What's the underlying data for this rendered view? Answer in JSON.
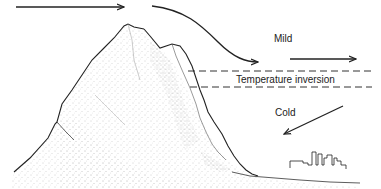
{
  "diagram": {
    "type": "illustration",
    "labels": {
      "mild": "Mild",
      "inversion": "Temperature inversion",
      "cold": "Cold"
    },
    "elements": [
      {
        "name": "mountain",
        "description": "stippled pen-and-ink mountain peak"
      },
      {
        "name": "wind-arrow-top",
        "description": "horizontal arrow above peak pointing right"
      },
      {
        "name": "wind-arrow-descending",
        "description": "curved arrow descending over lee slope"
      },
      {
        "name": "mild-arrow",
        "description": "horizontal arrow pointing right in mild layer"
      },
      {
        "name": "inversion-layer",
        "description": "two dashed horizontal lines bounding inversion"
      },
      {
        "name": "cold-arrow",
        "description": "diagonal arrow pointing down-left toward slope"
      },
      {
        "name": "city-skyline",
        "description": "small city buildings at base of mountain"
      }
    ],
    "colors": {
      "ink": "#222222",
      "background": "#ffffff",
      "stipple": "#8a8a8a"
    }
  }
}
